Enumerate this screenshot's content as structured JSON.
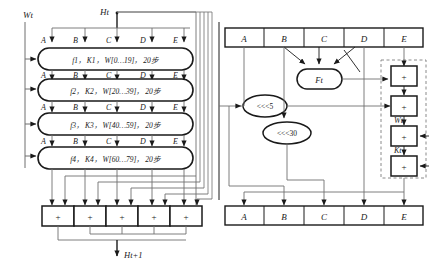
{
  "diagram": {
    "colors": {
      "stroke": "#1a1a1a",
      "thin_stroke": "#6f6f6f",
      "background": "#ffffff",
      "dashed": "#8a8a8a"
    },
    "left_panel": {
      "input_left_label": "Wt",
      "input_top_label": "Ht",
      "output_label": "Ht+1",
      "register_labels": [
        "A",
        "B",
        "C",
        "D",
        "E"
      ],
      "rounds": [
        {
          "f": "f1",
          "k": "K1",
          "w": "W[0…19]",
          "steps": "20步",
          "text": "f1， K1， W[0…19]， 20步"
        },
        {
          "f": "f2",
          "k": "K2",
          "w": "W[20…39]",
          "steps": "20步",
          "text": "f2， K2， W[20…39]， 20步"
        },
        {
          "f": "f3",
          "k": "K3",
          "w": "W[40…59]",
          "steps": "20步",
          "text": "f3， K3， W[40…59]， 20步"
        },
        {
          "f": "f4",
          "k": "K4",
          "w": "W[60…79]",
          "steps": "20步",
          "text": "f4， K4， W[60…79]， 20步"
        }
      ],
      "adders": [
        "+",
        "+",
        "+",
        "+",
        "+"
      ]
    },
    "right_panel": {
      "top_registers": [
        "A",
        "B",
        "C",
        "D",
        "E"
      ],
      "bottom_registers": [
        "A",
        "B",
        "C",
        "D",
        "E"
      ],
      "function_label": "Ft",
      "rotate_left_5": "<<<5",
      "rotate_left_30": "<<<30",
      "adders": [
        "+",
        "+",
        "+",
        "+"
      ],
      "input_w_label": "Wt",
      "input_k_label": "Kt"
    }
  }
}
